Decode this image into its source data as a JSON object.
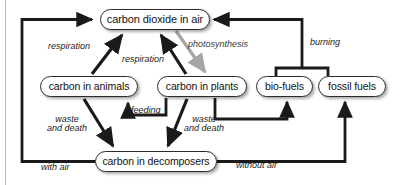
{
  "diagram": {
    "colors": {
      "arrow_black": "#1a1a1a",
      "arrow_gray": "#a6a6a6",
      "node_border": "#2b2b2b",
      "node_fill": "#ffffff",
      "page_edge": "#b9b9b9",
      "text": "#111111"
    },
    "nodes": [
      {
        "id": "carbon-dioxide-in-air",
        "label": "carbon dioxide in air",
        "x": 100,
        "y": 9,
        "w": 110,
        "h": 21,
        "font_size": 11
      },
      {
        "id": "carbon-in-animals",
        "label": "carbon in animals",
        "x": 40,
        "y": 76,
        "w": 98,
        "h": 21,
        "font_size": 10.5
      },
      {
        "id": "carbon-in-plants",
        "label": "carbon in plants",
        "x": 157,
        "y": 76,
        "w": 90,
        "h": 21,
        "font_size": 10.5
      },
      {
        "id": "bio-fuels",
        "label": "bio-fuels",
        "x": 256,
        "y": 76,
        "w": 57,
        "h": 21,
        "font_size": 10.5
      },
      {
        "id": "fossil-fuels",
        "label": "fossil fuels",
        "x": 318,
        "y": 76,
        "w": 68,
        "h": 21,
        "font_size": 10.5
      },
      {
        "id": "carbon-in-decomposers",
        "label": "carbon in decomposers",
        "x": 95,
        "y": 151,
        "w": 122,
        "h": 21,
        "font_size": 10.5
      }
    ],
    "edge_labels": [
      {
        "id": "respiration-animals",
        "text": "respiration",
        "x": 48,
        "y": 42,
        "font_size": 9
      },
      {
        "id": "respiration-plants",
        "text": "respiration",
        "x": 122,
        "y": 55,
        "font_size": 9
      },
      {
        "id": "photosynthesis",
        "text": "photosynthesis",
        "x": 188,
        "y": 40,
        "font_size": 9
      },
      {
        "id": "burning",
        "text": "burning",
        "x": 310,
        "y": 38,
        "font_size": 9
      },
      {
        "id": "feeding",
        "text": "feeding",
        "x": 131,
        "y": 106,
        "font_size": 9
      },
      {
        "id": "waste-and-death-animals",
        "text": "waste\nand death",
        "x": 47,
        "y": 115,
        "font_size": 9
      },
      {
        "id": "waste-and-death-plants",
        "text": "waste\nand death",
        "x": 184,
        "y": 115,
        "font_size": 9
      },
      {
        "id": "with-air",
        "text": "with air",
        "x": 41,
        "y": 163,
        "font_size": 9
      },
      {
        "id": "without-air",
        "text": "without air",
        "x": 236,
        "y": 161,
        "font_size": 9
      }
    ],
    "flows": [
      {
        "id": "flow-decomposers-to-co2-with-air",
        "from": "carbon-in-decomposers",
        "to": "carbon-dioxide-in-air",
        "label": "with air",
        "color": "black"
      },
      {
        "id": "flow-animals-to-co2",
        "from": "carbon-in-animals",
        "to": "carbon-dioxide-in-air",
        "label": "respiration",
        "color": "black"
      },
      {
        "id": "flow-plants-to-co2",
        "from": "carbon-in-plants",
        "to": "carbon-dioxide-in-air",
        "label": "respiration",
        "color": "black"
      },
      {
        "id": "flow-co2-to-plants",
        "from": "carbon-dioxide-in-air",
        "to": "carbon-in-plants",
        "label": "photosynthesis",
        "color": "gray"
      },
      {
        "id": "flow-plants-to-animals",
        "from": "carbon-in-plants",
        "to": "carbon-in-animals",
        "label": "feeding",
        "color": "black"
      },
      {
        "id": "flow-animals-to-decomposers",
        "from": "carbon-in-animals",
        "to": "carbon-in-decomposers",
        "label": "waste and death",
        "color": "black"
      },
      {
        "id": "flow-plants-to-decomposers",
        "from": "carbon-in-plants",
        "to": "carbon-in-decomposers",
        "label": "waste and death",
        "color": "black"
      },
      {
        "id": "flow-plants-to-biofuels",
        "from": "carbon-in-plants",
        "to": "bio-fuels",
        "label": "",
        "color": "black"
      },
      {
        "id": "flow-decomposers-to-fossilfuels-without-air",
        "from": "carbon-in-decomposers",
        "to": "fossil fuels",
        "label": "without air",
        "color": "black"
      },
      {
        "id": "flow-fuels-to-co2",
        "from": "bio-fuels and fossil fuels",
        "to": "carbon-dioxide-in-air",
        "label": "burning",
        "color": "black"
      }
    ]
  }
}
